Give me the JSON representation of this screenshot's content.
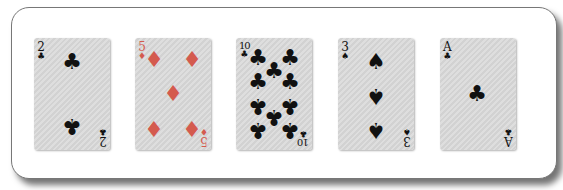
{
  "hand": {
    "cards": [
      {
        "rank": "2",
        "suit": "clubs",
        "symbol": "♣",
        "color": "black"
      },
      {
        "rank": "5",
        "suit": "diamonds",
        "symbol": "♦",
        "color": "red"
      },
      {
        "rank": "10",
        "suit": "clubs",
        "symbol": "♣",
        "color": "black"
      },
      {
        "rank": "3",
        "suit": "spades",
        "symbol": "♠",
        "color": "black"
      },
      {
        "rank": "A",
        "suit": "clubs",
        "symbol": "♣",
        "color": "black"
      }
    ]
  },
  "colors": {
    "black_suit": "#111111",
    "red_suit": "#d45a4e",
    "card_bg": "#d8d8d8"
  }
}
